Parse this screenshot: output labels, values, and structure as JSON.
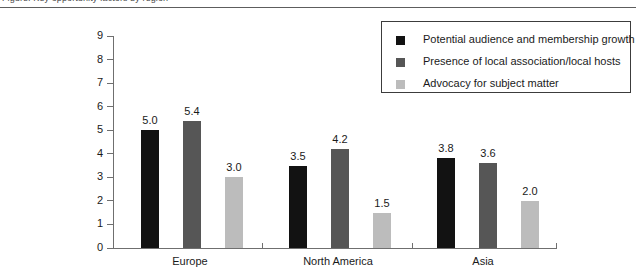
{
  "caption": {
    "text": "Figure: Key opportunity factors by region"
  },
  "legend": {
    "entries": [
      {
        "label": "Potential audience and membership growth",
        "color": "#121212",
        "swatch": "legend-swatch-black"
      },
      {
        "label": "Presence of local association/local hosts",
        "color": "#565656",
        "swatch": "legend-swatch-darkgray"
      },
      {
        "label": "Advocacy for subject matter",
        "color": "#bcbcbc",
        "swatch": "legend-swatch-lightgray"
      }
    ]
  },
  "axis": {
    "y_ticks": [
      "0",
      "1",
      "2",
      "3",
      "4",
      "5",
      "6",
      "7",
      "8",
      "9"
    ]
  },
  "chart_data": {
    "type": "bar",
    "title": "",
    "xlabel": "",
    "ylabel": "",
    "ylim": [
      0,
      9
    ],
    "grid": false,
    "legend_position": "top-right",
    "categories": [
      "Europe",
      "North America",
      "Asia"
    ],
    "series": [
      {
        "name": "Potential audience and membership growth",
        "color": "#121212",
        "values": [
          5.0,
          3.5,
          3.8
        ],
        "labels": [
          "5.0",
          "3.5",
          "3.8"
        ]
      },
      {
        "name": "Presence of local association/local hosts",
        "color": "#565656",
        "values": [
          5.4,
          4.2,
          3.6
        ],
        "labels": [
          "5.4",
          "4.2",
          "3.6"
        ]
      },
      {
        "name": "Advocacy for subject matter",
        "color": "#bcbcbc",
        "values": [
          3.0,
          1.5,
          2.0
        ],
        "labels": [
          "3.0",
          "1.5",
          "2.0"
        ]
      }
    ]
  }
}
